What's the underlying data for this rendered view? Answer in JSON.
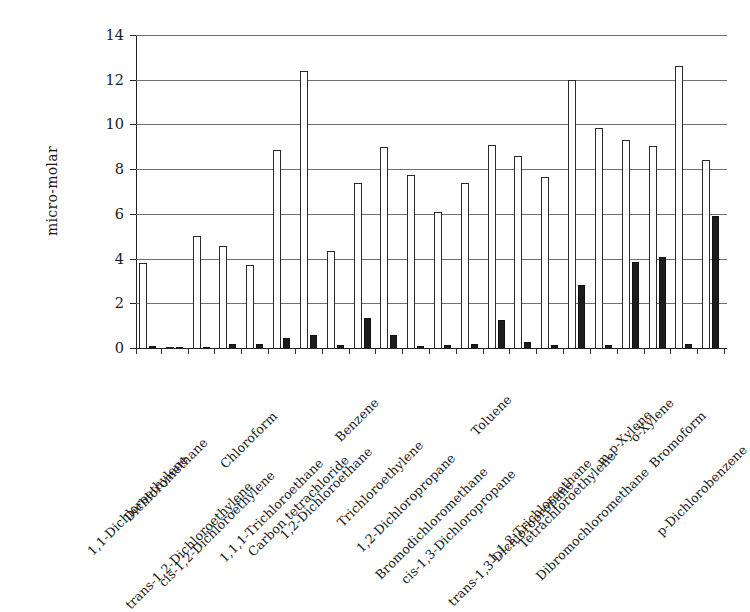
{
  "chart_data": {
    "type": "bar",
    "title": "",
    "xlabel": "",
    "ylabel": "micro-molar",
    "ylim": [
      0,
      14
    ],
    "yticks": [
      0,
      2,
      4,
      6,
      8,
      10,
      12,
      14
    ],
    "grid": true,
    "legend": "none",
    "orientation": "vertical",
    "grouping": "paired",
    "categories": [
      "1,1-Dichloroethylene",
      "Dichloromethane",
      "trans-1,2-Dichloroethylene",
      "cis-1,2-Dichloroethylene",
      "Chloroform",
      "1,1,1-Trichloroethane",
      "Carbon tetrachloride",
      "1,2-Dichloroethane",
      "Benzene",
      "Trichloroethylene",
      "1,2-Dichloropropane",
      "Bromodichloromethane",
      "cis-1,3-Dichloropropane",
      "Toluene",
      "trans-1,3-Dichloropropane",
      "1,1,2-Trichloroethane",
      "Tetrachloroethylene",
      "Dibromochloromethane",
      "m,p-Xylene",
      "o-Xylene",
      "Bromoform",
      "p-Dichlorobenzene"
    ],
    "series": [
      {
        "name": "open",
        "style": "white-filled-outlined",
        "values": [
          3.8,
          0.05,
          5.0,
          4.55,
          3.7,
          8.85,
          12.4,
          4.35,
          7.4,
          9.0,
          7.75,
          6.1,
          7.4,
          9.1,
          8.6,
          7.65,
          12.0,
          9.85,
          9.3,
          9.05,
          12.6,
          8.4
        ]
      },
      {
        "name": "solid",
        "style": "black-filled",
        "values": [
          0.1,
          0.02,
          0.05,
          0.2,
          0.18,
          0.45,
          0.6,
          0.12,
          1.35,
          0.6,
          0.1,
          0.15,
          0.2,
          1.25,
          0.25,
          0.15,
          2.8,
          0.15,
          3.85,
          4.05,
          0.2,
          5.9
        ]
      }
    ]
  },
  "axis": {
    "y_title": "micro-molar"
  }
}
